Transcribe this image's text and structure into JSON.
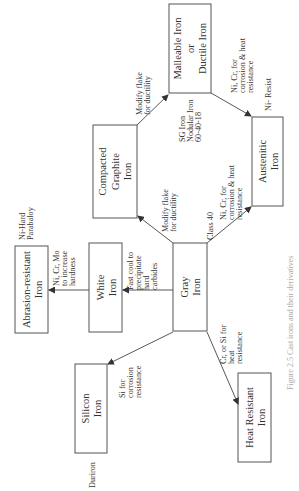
{
  "caption": "Figure 2.5  Cast irons and their derivatives",
  "nodes": {
    "gray": [
      "Gray",
      "Iron"
    ],
    "white": [
      "White",
      "Iron"
    ],
    "abrasion": [
      "Abrasion-resistant",
      "Iron"
    ],
    "silicon": [
      "Silicon",
      "Iron"
    ],
    "heat": [
      "Heat Resistant",
      "Iron"
    ],
    "compacted": [
      "Compacted",
      "Graphite",
      "Iron"
    ],
    "malleable": [
      "Malleable Iron",
      "or",
      "Ductile Iron"
    ],
    "austenitic": [
      "Austenitic",
      "Iron"
    ]
  },
  "edges": {
    "gray_white": [
      "Fast cool to",
      "precipitate",
      "hard",
      "carbides"
    ],
    "white_abrasion": [
      "Ni, Cr, Mo",
      "to increase",
      "hardness"
    ],
    "gray_silicon": [
      "Si for",
      "corrosion",
      "resistance"
    ],
    "gray_heat": [
      "Cr, or Si for",
      "heat",
      "resistance"
    ],
    "gray_compacted": [
      "Modify flake",
      "for ductility"
    ],
    "compacted_malleable": [
      "Modify flake",
      "for ductility"
    ],
    "gray_austenitic": [
      "Ni, Cr, for",
      "corrosion &  heat",
      "resistance"
    ],
    "malleable_austenitic": [
      "Ni, Cr, for",
      "corrosion & heat",
      "resistance"
    ]
  },
  "notes": {
    "class40": "Class 40",
    "sg_iron": [
      "SG Iron",
      "Nodular Iron",
      "60-40-18"
    ],
    "ni_resist": "Ni- Resist",
    "ni_hard": [
      "Ni-Hard",
      "Parabaloy"
    ],
    "duriron": "Duriron"
  }
}
